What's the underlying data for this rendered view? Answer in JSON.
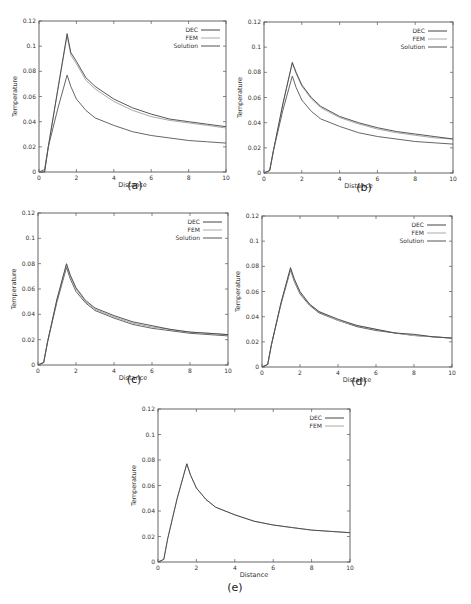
{
  "chart_data": [
    {
      "type": "line",
      "panel": "(a)",
      "title": "",
      "xlabel": "Distance",
      "ylabel": "Temperature",
      "xlim": [
        0,
        10
      ],
      "ylim": [
        0,
        0.12
      ],
      "xticks": [
        "0",
        "2",
        "4",
        "6",
        "8",
        "10"
      ],
      "yticks": [
        "0",
        "0.02",
        "0.04",
        "0.06",
        "0.08",
        "0.1",
        "0.12"
      ],
      "legend": [
        "DEC",
        "FEM",
        "Solution"
      ],
      "legend_position": "upper right",
      "grid": false,
      "x": [
        0,
        0.3,
        0.5,
        1.0,
        1.5,
        1.7,
        2.0,
        2.5,
        3,
        4,
        5,
        6,
        7,
        8,
        9,
        10
      ],
      "series": [
        {
          "name": "DEC",
          "color": "#444444",
          "values": [
            0,
            0,
            0.02,
            0.065,
            0.11,
            0.095,
            0.088,
            0.075,
            0.068,
            0.058,
            0.051,
            0.046,
            0.042,
            0.04,
            0.038,
            0.036
          ]
        },
        {
          "name": "FEM",
          "color": "#aaaaaa",
          "values": [
            0,
            0,
            0.02,
            0.065,
            0.108,
            0.093,
            0.086,
            0.073,
            0.066,
            0.056,
            0.049,
            0.044,
            0.041,
            0.039,
            0.037,
            0.035
          ]
        },
        {
          "name": "Solution",
          "color": "#555555",
          "values": [
            0,
            0.002,
            0.02,
            0.05,
            0.077,
            0.068,
            0.058,
            0.049,
            0.043,
            0.037,
            0.032,
            0.029,
            0.027,
            0.025,
            0.024,
            0.023
          ]
        }
      ]
    },
    {
      "type": "line",
      "panel": "(b)",
      "xlabel": "Distance",
      "ylabel": "Temperature",
      "xlim": [
        0,
        10
      ],
      "ylim": [
        0,
        0.12
      ],
      "xticks": [
        "0",
        "2",
        "4",
        "6",
        "8",
        "10"
      ],
      "yticks": [
        "0",
        "0.02",
        "0.04",
        "0.06",
        "0.08",
        "0.1",
        "0.12"
      ],
      "legend": [
        "DEC",
        "FEM",
        "Solution"
      ],
      "legend_position": "upper right",
      "grid": false,
      "x": [
        0,
        0.3,
        0.5,
        1.0,
        1.5,
        1.7,
        2.0,
        2.5,
        3,
        4,
        5,
        6,
        7,
        8,
        9,
        10
      ],
      "series": [
        {
          "name": "DEC",
          "color": "#444444",
          "values": [
            0,
            0.002,
            0.018,
            0.055,
            0.088,
            0.08,
            0.07,
            0.06,
            0.053,
            0.045,
            0.04,
            0.036,
            0.033,
            0.031,
            0.029,
            0.027
          ]
        },
        {
          "name": "FEM",
          "color": "#aaaaaa",
          "values": [
            0,
            0.002,
            0.018,
            0.055,
            0.087,
            0.079,
            0.069,
            0.059,
            0.052,
            0.044,
            0.039,
            0.035,
            0.032,
            0.03,
            0.028,
            0.027
          ]
        },
        {
          "name": "Solution",
          "color": "#555555",
          "values": [
            0,
            0.002,
            0.018,
            0.05,
            0.077,
            0.068,
            0.058,
            0.049,
            0.043,
            0.037,
            0.032,
            0.029,
            0.027,
            0.025,
            0.024,
            0.023
          ]
        }
      ]
    },
    {
      "type": "line",
      "panel": "(c)",
      "xlabel": "Distance",
      "ylabel": "Temperature",
      "xlim": [
        0,
        10
      ],
      "ylim": [
        0,
        0.12
      ],
      "xticks": [
        "0",
        "2",
        "4",
        "6",
        "8",
        "10"
      ],
      "yticks": [
        "0",
        "0.02",
        "0.04",
        "0.06",
        "0.08",
        "0.1",
        "0.12"
      ],
      "legend": [
        "DEC",
        "FEM",
        "Solution"
      ],
      "legend_position": "upper right",
      "grid": false,
      "x": [
        0,
        0.3,
        0.5,
        1.0,
        1.5,
        1.7,
        2.0,
        2.5,
        3,
        4,
        5,
        6,
        7,
        8,
        9,
        10
      ],
      "series": [
        {
          "name": "DEC",
          "color": "#444444",
          "values": [
            0,
            0.002,
            0.018,
            0.052,
            0.08,
            0.071,
            0.061,
            0.051,
            0.045,
            0.039,
            0.034,
            0.031,
            0.028,
            0.026,
            0.025,
            0.024
          ]
        },
        {
          "name": "FEM",
          "color": "#aaaaaa",
          "values": [
            0,
            0.002,
            0.018,
            0.052,
            0.079,
            0.07,
            0.06,
            0.05,
            0.044,
            0.038,
            0.033,
            0.03,
            0.028,
            0.026,
            0.025,
            0.024
          ]
        },
        {
          "name": "Solution",
          "color": "#555555",
          "values": [
            0,
            0.002,
            0.018,
            0.05,
            0.077,
            0.068,
            0.058,
            0.049,
            0.043,
            0.037,
            0.032,
            0.029,
            0.027,
            0.025,
            0.024,
            0.023
          ]
        }
      ]
    },
    {
      "type": "line",
      "panel": "(d)",
      "xlabel": "Distance",
      "ylabel": "Temperature",
      "xlim": [
        0,
        10
      ],
      "ylim": [
        0,
        0.12
      ],
      "xticks": [
        "0",
        "2",
        "4",
        "6",
        "8",
        "10"
      ],
      "yticks": [
        "0",
        "0.02",
        "0.04",
        "0.06",
        "0.08",
        "0.1",
        "0.12"
      ],
      "legend": [
        "DEC",
        "FEM",
        "Solution"
      ],
      "legend_position": "upper right",
      "grid": false,
      "x": [
        0,
        0.3,
        0.5,
        1.0,
        1.5,
        1.7,
        2.0,
        2.5,
        3,
        4,
        5,
        6,
        7,
        8,
        9,
        10
      ],
      "series": [
        {
          "name": "DEC",
          "color": "#444444",
          "values": [
            0,
            0.002,
            0.018,
            0.051,
            0.079,
            0.07,
            0.06,
            0.05,
            0.044,
            0.038,
            0.033,
            0.03,
            0.027,
            0.026,
            0.024,
            0.023
          ]
        },
        {
          "name": "FEM",
          "color": "#aaaaaa",
          "values": [
            0,
            0.002,
            0.018,
            0.051,
            0.078,
            0.069,
            0.059,
            0.05,
            0.044,
            0.037,
            0.033,
            0.03,
            0.027,
            0.025,
            0.024,
            0.023
          ]
        },
        {
          "name": "Solution",
          "color": "#555555",
          "values": [
            0,
            0.002,
            0.018,
            0.05,
            0.077,
            0.068,
            0.058,
            0.049,
            0.043,
            0.037,
            0.032,
            0.029,
            0.027,
            0.025,
            0.024,
            0.023
          ]
        }
      ]
    },
    {
      "type": "line",
      "panel": "(e)",
      "xlabel": "Distance",
      "ylabel": "Temperature",
      "xlim": [
        0,
        10
      ],
      "ylim": [
        0,
        0.12
      ],
      "xticks": [
        "0",
        "2",
        "4",
        "6",
        "8",
        "10"
      ],
      "yticks": [
        "0",
        "0.02",
        "0.04",
        "0.06",
        "0.08",
        "0.1",
        "0.12"
      ],
      "legend": [
        "DEC",
        "FEM"
      ],
      "legend_position": "upper right",
      "grid": false,
      "x": [
        0,
        0.3,
        0.5,
        1.0,
        1.5,
        1.7,
        2.0,
        2.5,
        3,
        4,
        5,
        6,
        7,
        8,
        9,
        10
      ],
      "series": [
        {
          "name": "DEC",
          "color": "#444444",
          "values": [
            0,
            0.002,
            0.018,
            0.05,
            0.077,
            0.068,
            0.058,
            0.049,
            0.043,
            0.037,
            0.032,
            0.029,
            0.027,
            0.025,
            0.024,
            0.023
          ]
        },
        {
          "name": "FEM",
          "color": "#aaaaaa",
          "values": [
            0,
            0.002,
            0.018,
            0.05,
            0.077,
            0.068,
            0.058,
            0.049,
            0.043,
            0.037,
            0.032,
            0.029,
            0.027,
            0.025,
            0.024,
            0.023
          ]
        }
      ]
    }
  ],
  "captions": [
    "(a)",
    "(b)",
    "(c)",
    "(d)",
    "(e)"
  ],
  "layout": [
    {
      "left": 39,
      "top": 21,
      "right": 226,
      "bottom": 172,
      "caption_x": 80,
      "caption_y": 182
    },
    {
      "left": 264,
      "top": 22,
      "right": 453,
      "bottom": 173,
      "caption_x": 103,
      "caption_y": 184
    },
    {
      "left": 38,
      "top": 213,
      "right": 228,
      "bottom": 365,
      "caption_x": 82,
      "caption_y": 376
    },
    {
      "left": 262,
      "top": 216,
      "right": 452,
      "bottom": 367,
      "caption_x": 98,
      "caption_y": 377
    },
    {
      "left": 158,
      "top": 409,
      "right": 350,
      "bottom": 562,
      "caption_x": 88,
      "caption_y": 583
    }
  ]
}
